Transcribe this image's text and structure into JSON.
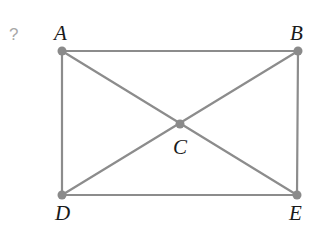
{
  "diagram": {
    "problem_marker": "?",
    "colors": {
      "edge": "#8c8c8c",
      "vertex": "#8a8a8a",
      "label": "#1a1a1a",
      "marker": "#a8a8a8"
    },
    "vertices": [
      {
        "id": "A",
        "label": "A",
        "x": 62,
        "y": 51
      },
      {
        "id": "B",
        "label": "B",
        "x": 298,
        "y": 51
      },
      {
        "id": "C",
        "label": "C",
        "x": 180,
        "y": 124
      },
      {
        "id": "D",
        "label": "D",
        "x": 62,
        "y": 195
      },
      {
        "id": "E",
        "label": "E",
        "x": 297,
        "y": 195
      }
    ],
    "edges": [
      [
        "A",
        "B"
      ],
      [
        "B",
        "E"
      ],
      [
        "E",
        "D"
      ],
      [
        "D",
        "A"
      ],
      [
        "A",
        "E"
      ],
      [
        "B",
        "D"
      ]
    ]
  }
}
